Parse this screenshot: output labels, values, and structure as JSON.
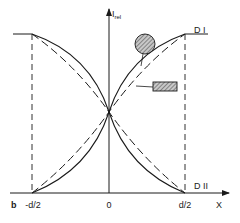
{
  "figure": {
    "panel_label": "b",
    "y_axis_label": "I",
    "y_axis_subscript": "rel",
    "x_axis_label": "X",
    "x_ticks": [
      "-d/2",
      "0",
      "d/2"
    ],
    "curve_labels": {
      "top": "D I",
      "bottom": "D II"
    },
    "legend": [
      {
        "shape": "hatched-circle",
        "line_style": "solid",
        "meaning": "circular cross-section"
      },
      {
        "shape": "hatched-rectangle",
        "line_style": "dashed",
        "meaning": "rectangular cross-section"
      }
    ],
    "colors": {
      "line": "#1a1a1a",
      "hatch_fill": "#9a9a9a",
      "background": "#ffffff"
    }
  }
}
